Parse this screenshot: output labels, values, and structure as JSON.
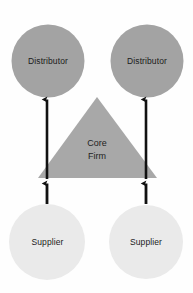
{
  "diagram": {
    "background_color": "#fefefe",
    "colors": {
      "distributor_fill": "#a3a3a3",
      "supplier_fill": "#eaeaea",
      "core_firm_fill": "#a8a8a8",
      "arrow_color": "#111111",
      "label_text": "#1a1a1a"
    },
    "nodes": [
      {
        "id": "distributor-left",
        "label": "Distributor",
        "shape": "circle",
        "fill": "#a3a3a3",
        "cx": 48,
        "cy": 61,
        "r": 36.5
      },
      {
        "id": "distributor-right",
        "label": "Distributor",
        "shape": "circle",
        "fill": "#a3a3a3",
        "cx": 147,
        "cy": 61,
        "r": 36.5
      },
      {
        "id": "core-firm",
        "label_line1": "Core",
        "label_line2": "Firm",
        "shape": "triangle",
        "fill": "#a8a8a8",
        "apex_x": 97,
        "apex_y": 97,
        "base_y": 178,
        "base_left_x": 38,
        "base_right_x": 157
      },
      {
        "id": "supplier-left",
        "label": "Supplier",
        "shape": "circle",
        "fill": "#eaeaea",
        "cx": 47,
        "cy": 242,
        "r": 38
      },
      {
        "id": "supplier-right",
        "label": "Supplier",
        "shape": "circle",
        "fill": "#eaeaea",
        "cx": 146,
        "cy": 242,
        "r": 37
      }
    ],
    "arrows": [
      {
        "id": "arrow-core-to-distributor-left",
        "direction": "up",
        "x": 47,
        "y_start": 179,
        "y_end": 96
      },
      {
        "id": "arrow-core-to-distributor-right",
        "direction": "up",
        "x": 146,
        "y_start": 179,
        "y_end": 96
      },
      {
        "id": "arrow-supplier-left-to-core",
        "direction": "up",
        "x": 47,
        "y_start": 204,
        "y_end": 180
      },
      {
        "id": "arrow-supplier-right-to-core",
        "direction": "up",
        "x": 146,
        "y_start": 204,
        "y_end": 180
      }
    ]
  }
}
